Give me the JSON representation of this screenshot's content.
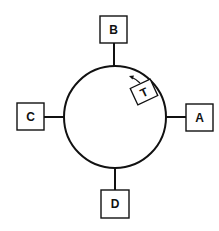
{
  "diagram": {
    "type": "token-ring-network",
    "stroke_color": "#111111",
    "background": "#ffffff",
    "ring": {
      "cx": 115,
      "cy": 117,
      "r": 51
    },
    "token": {
      "label": "T",
      "cx": 144,
      "cy": 92,
      "angle": -25
    },
    "nodes": [
      {
        "id": "A",
        "label": "A",
        "x": 186,
        "y": 104,
        "w": 27,
        "h": 27,
        "stem": [
          166,
          117,
          186,
          117
        ],
        "tx": 199.5,
        "ty": 122
      },
      {
        "id": "B",
        "label": "B",
        "x": 100,
        "y": 16,
        "w": 27,
        "h": 27,
        "stem": [
          114,
          43,
          114,
          66
        ],
        "tx": 113.5,
        "ty": 34
      },
      {
        "id": "C",
        "label": "C",
        "x": 17,
        "y": 103,
        "w": 27,
        "h": 27,
        "stem": [
          44,
          117,
          64,
          117
        ],
        "tx": 30.5,
        "ty": 121
      },
      {
        "id": "D",
        "label": "D",
        "x": 101,
        "y": 190,
        "w": 28,
        "h": 28,
        "stem": [
          115,
          168,
          115,
          190
        ],
        "tx": 115,
        "ty": 208
      }
    ]
  }
}
